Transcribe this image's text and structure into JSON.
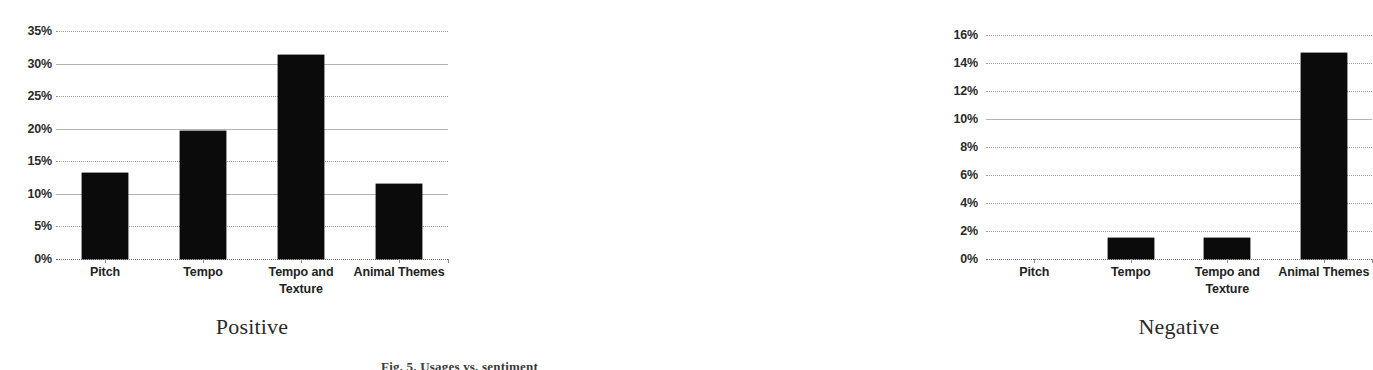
{
  "figure": {
    "caption": "Fig. 5. Usages vs. sentiment",
    "panel_titles": [
      "Positive",
      "Negative"
    ]
  },
  "chart_data": [
    {
      "type": "bar",
      "title": "Positive",
      "xlabel": "",
      "ylabel": "",
      "categories": [
        "Pitch",
        "Tempo",
        "Tempo and Texture",
        "Animal Themes"
      ],
      "values": [
        13.2,
        19.6,
        31.3,
        11.5
      ],
      "ylim": [
        0,
        35
      ],
      "ytick_step": 5,
      "ytick_labels": [
        "0%",
        "5%",
        "10%",
        "15%",
        "20%",
        "25%",
        "30%",
        "35%"
      ],
      "ytick_values": [
        0,
        5,
        10,
        15,
        20,
        25,
        30,
        35
      ],
      "grid": true,
      "legend": "none",
      "bar_color": "#0b0b0b"
    },
    {
      "type": "bar",
      "title": "Negative",
      "xlabel": "",
      "ylabel": "",
      "categories": [
        "Pitch",
        "Tempo",
        "Tempo and Texture",
        "Animal Themes"
      ],
      "values": [
        0,
        1.5,
        1.5,
        14.7
      ],
      "ylim": [
        0,
        16
      ],
      "ytick_step": 2,
      "ytick_labels": [
        "0%",
        "2%",
        "4%",
        "6%",
        "8%",
        "10%",
        "12%",
        "14%",
        "16%"
      ],
      "ytick_values": [
        0,
        2,
        4,
        6,
        8,
        10,
        12,
        14,
        16
      ],
      "grid": true,
      "legend": "none",
      "bar_color": "#0b0b0b"
    }
  ]
}
